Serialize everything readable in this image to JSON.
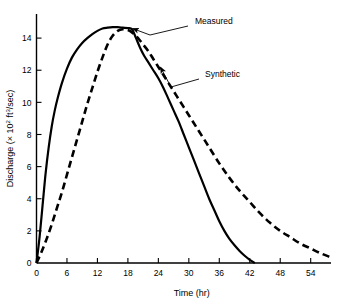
{
  "chart_data": {
    "type": "line",
    "title": "",
    "xlabel": "Time (hr)",
    "ylabel": "Discharge (× 10² ft³/sec)",
    "ylabel_parts": {
      "prefix": "Discharge (× 10",
      "exp1": "2",
      "mid": " ft",
      "exp2": "3",
      "suffix": "/sec)"
    },
    "xlim": [
      0,
      58
    ],
    "ylim": [
      0,
      15.5
    ],
    "xticks": [
      0,
      6,
      12,
      18,
      24,
      30,
      36,
      42,
      48,
      54
    ],
    "xtick_labels": [
      "0",
      "6",
      "12",
      "18",
      "24",
      "30",
      "36",
      "42",
      "48",
      "54"
    ],
    "yticks": [
      0,
      2,
      4,
      6,
      8,
      10,
      12,
      14
    ],
    "ytick_labels": [
      "0",
      "2",
      "4",
      "6",
      "8",
      "10",
      "12",
      "14"
    ],
    "grid": false,
    "legend_position": "annotations-inline",
    "series": [
      {
        "name": "Measured",
        "style": "solid",
        "color": "#000000",
        "x": [
          0.0,
          0.6,
          1.2,
          1.8,
          2.4,
          3.0,
          3.6,
          4.2,
          5.0,
          6.0,
          7.0,
          8.0,
          9.0,
          10.0,
          11.0,
          12.0,
          13.0,
          14.0,
          15.0,
          16.0,
          17.0,
          18.0,
          18.6,
          19.0,
          19.6,
          20.4,
          21.2,
          22.0,
          23.0,
          24.0,
          25.0,
          26.0,
          27.0,
          28.0,
          29.0,
          30.0,
          31.0,
          32.0,
          33.0,
          34.0,
          35.0,
          36.0,
          37.0,
          38.0,
          39.0,
          40.0,
          41.0,
          42.0,
          43.0
        ],
        "y": [
          0.0,
          1.6,
          3.6,
          5.6,
          7.2,
          8.5,
          9.5,
          10.3,
          11.2,
          12.1,
          12.8,
          13.3,
          13.7,
          14.0,
          14.25,
          14.45,
          14.6,
          14.65,
          14.68,
          14.68,
          14.65,
          14.62,
          14.6,
          14.45,
          14.0,
          13.4,
          12.9,
          12.5,
          12.0,
          11.5,
          10.9,
          10.2,
          9.5,
          8.8,
          8.0,
          7.2,
          6.4,
          5.6,
          4.8,
          4.0,
          3.3,
          2.6,
          2.0,
          1.5,
          1.1,
          0.75,
          0.45,
          0.2,
          0.0
        ]
      },
      {
        "name": "Synthetic",
        "style": "dashed",
        "color": "#000000",
        "x": [
          0.0,
          1.0,
          2.0,
          3.0,
          4.0,
          5.0,
          6.0,
          7.0,
          8.0,
          9.0,
          10.0,
          11.0,
          12.0,
          13.0,
          14.0,
          15.0,
          16.0,
          17.0,
          18.0,
          19.0,
          20.0,
          21.0,
          22.0,
          23.0,
          24.0,
          25.0,
          26.0,
          27.0,
          28.0,
          29.0,
          30.0,
          31.0,
          32.0,
          33.0,
          34.0,
          36.0,
          38.0,
          40.0,
          42.0,
          44.0,
          46.0,
          48.0,
          50.0,
          52.0,
          54.0,
          56.0,
          58.0
        ],
        "y": [
          0.0,
          0.7,
          1.5,
          2.4,
          3.4,
          4.4,
          5.5,
          6.6,
          7.7,
          8.8,
          9.9,
          10.9,
          11.9,
          12.8,
          13.6,
          14.15,
          14.45,
          14.55,
          14.5,
          14.3,
          14.0,
          13.6,
          13.2,
          12.7,
          12.2,
          11.7,
          11.2,
          10.7,
          10.2,
          9.7,
          9.2,
          8.7,
          8.2,
          7.7,
          7.2,
          6.2,
          5.3,
          4.5,
          3.8,
          3.1,
          2.5,
          2.0,
          1.6,
          1.2,
          0.9,
          0.6,
          0.35
        ]
      }
    ],
    "annotations": [
      {
        "name": "Measured",
        "label": "Measured",
        "label_x": 195,
        "label_y": 24,
        "leader_from_x": 188,
        "leader_from_y": 26,
        "leader_to_x": 150,
        "leader_to_y": 35,
        "target_x": 0,
        "target_y": 0
      },
      {
        "name": "Synthetic",
        "label": "Synthetic",
        "label_x": 205,
        "label_y": 77,
        "leader_from_x": 199,
        "leader_from_y": 79,
        "leader_to_x": 171,
        "leader_to_y": 87,
        "target_x": 0,
        "target_y": 0
      }
    ]
  }
}
